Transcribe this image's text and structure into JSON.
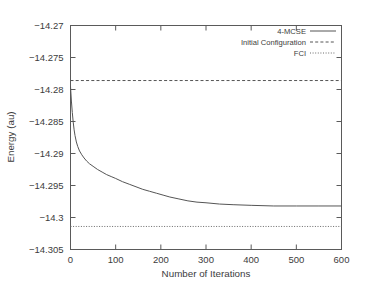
{
  "chart_data": {
    "type": "line",
    "title": "",
    "xlabel": "Number of Iterations",
    "ylabel": "Energy (au)",
    "xlim": [
      0,
      600
    ],
    "ylim": [
      -14.305,
      -14.27
    ],
    "xticks": [
      "0",
      "100",
      "200",
      "300",
      "400",
      "500",
      "600"
    ],
    "xtick_values": [
      0,
      100,
      200,
      300,
      400,
      500,
      600
    ],
    "yticks": [
      "-14.27",
      "-14.275",
      "-14.28",
      "-14.285",
      "-14.29",
      "-14.295",
      "-14.3",
      "-14.305"
    ],
    "ytick_values": [
      -14.27,
      -14.275,
      -14.28,
      -14.285,
      -14.29,
      -14.295,
      -14.3,
      -14.305
    ],
    "grid": false,
    "legend_position": "top-right",
    "series": [
      {
        "name": "4-MCSE",
        "style": "solid",
        "color": "#555555",
        "x": [
          0,
          2,
          4,
          6,
          8,
          10,
          13,
          16,
          20,
          25,
          30,
          36,
          42,
          50,
          60,
          70,
          80,
          90,
          100,
          115,
          130,
          145,
          160,
          175,
          190,
          205,
          220,
          240,
          260,
          280,
          300,
          330,
          360,
          400,
          450,
          500,
          550,
          600
        ],
        "y": [
          -14.2795,
          -14.2818,
          -14.2836,
          -14.2851,
          -14.2863,
          -14.2872,
          -14.2882,
          -14.2889,
          -14.2896,
          -14.2902,
          -14.2907,
          -14.2912,
          -14.2916,
          -14.292,
          -14.2925,
          -14.2929,
          -14.2933,
          -14.2936,
          -14.2939,
          -14.2944,
          -14.2948,
          -14.2952,
          -14.2956,
          -14.2959,
          -14.2962,
          -14.2965,
          -14.2968,
          -14.2971,
          -14.2974,
          -14.2976,
          -14.2977,
          -14.2979,
          -14.298,
          -14.2981,
          -14.2982,
          -14.2982,
          -14.2982,
          -14.2982
        ]
      },
      {
        "name": "Initial Configuration",
        "style": "dashed",
        "color": "#555555",
        "constant_y": -14.2786
      },
      {
        "name": "FCI",
        "style": "dotted",
        "color": "#6a6a6a",
        "constant_y": -14.3014
      }
    ]
  },
  "axes": {
    "y_title": "Energy (au)",
    "x_title": "Number of Iterations"
  },
  "legend": {
    "entries": [
      {
        "label": "4-MCSE",
        "style": "solid"
      },
      {
        "label": "Initial Configuration",
        "style": "dashed"
      },
      {
        "label": "FCI",
        "style": "dotted"
      }
    ]
  }
}
